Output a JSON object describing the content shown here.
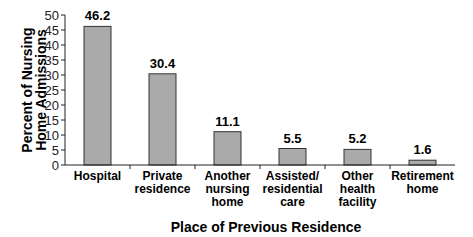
{
  "chart_data": {
    "type": "bar",
    "title": "",
    "xlabel": "Place of Previous Residence",
    "ylabel": [
      "Percent of Nursing",
      "Home Admissions"
    ],
    "categories": [
      [
        "Hospital"
      ],
      [
        "Private",
        "residence"
      ],
      [
        "Another",
        "nursing",
        "home"
      ],
      [
        "Assisted/",
        "residential",
        "care"
      ],
      [
        "Other",
        "health",
        "facility"
      ],
      [
        "Retirement",
        "home"
      ]
    ],
    "values": [
      46.2,
      30.4,
      11.1,
      5.5,
      5.2,
      1.6
    ],
    "value_labels": [
      "46.2",
      "30.4",
      "11.1",
      "5.5",
      "5.2",
      "1.6"
    ],
    "ylim": [
      0,
      50
    ],
    "yticks": [
      0,
      5,
      10,
      15,
      20,
      25,
      30,
      35,
      40,
      45,
      50
    ],
    "grid": false,
    "legend": null,
    "bar_color": "#aaaaaa",
    "bar_edge_color": "#333333"
  }
}
